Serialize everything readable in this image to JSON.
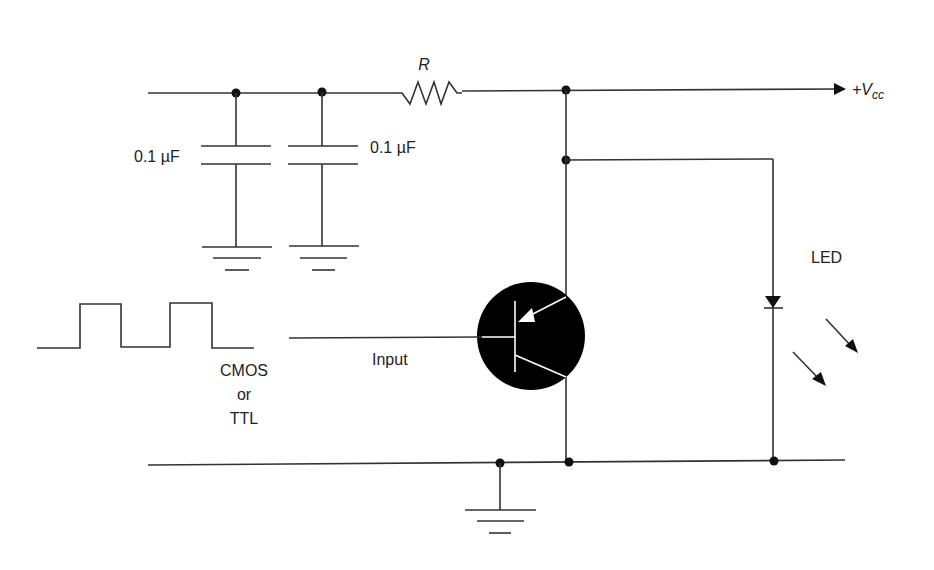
{
  "diagram": {
    "type": "circuit-schematic",
    "title": "",
    "labels": {
      "resistor": "R",
      "vcc_prefix": "+V",
      "vcc_sub": "cc",
      "cap1_value": "0.1 µF",
      "cap2_value": "0.1 µF",
      "led": "LED",
      "input": "Input",
      "source_line1": "CMOS",
      "source_line2": "or",
      "source_line3": "TTL"
    },
    "components": [
      {
        "id": "R",
        "kind": "resistor",
        "label": "R"
      },
      {
        "id": "C1",
        "kind": "capacitor",
        "value": "0.1 µF"
      },
      {
        "id": "C2",
        "kind": "capacitor",
        "value": "0.1 µF"
      },
      {
        "id": "Q1",
        "kind": "pnp-transistor"
      },
      {
        "id": "D1",
        "kind": "led",
        "label": "LED"
      },
      {
        "id": "SRC",
        "kind": "square-wave-source",
        "label": "CMOS or TTL"
      }
    ],
    "colors": {
      "wire": "#333333",
      "transistor_body": "#000000",
      "background": "#ffffff"
    }
  }
}
